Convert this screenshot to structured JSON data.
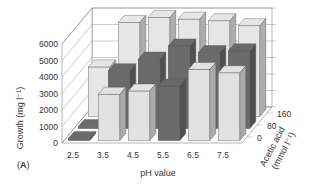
{
  "chart_data": {
    "type": "bar3d",
    "panel_label": "(A)",
    "xlabel": "pH value",
    "ylabel": "Growth (mg l⁻¹)",
    "zlabel_line1": "Acetic acid",
    "zlabel_line2": "(mmol l⁻¹)",
    "x_categories": [
      "2.5",
      "3.5",
      "4.5",
      "5.5",
      "6.5",
      "7.5"
    ],
    "z_categories": [
      "0",
      "80",
      "160"
    ],
    "y_ticks": [
      "0",
      "1000",
      "2000",
      "3000",
      "4000",
      "5000",
      "6000"
    ],
    "ylim": [
      0,
      6000
    ],
    "grid": true,
    "series": [
      {
        "name": "0",
        "color": "#e6e6e6",
        "values": [
          3000,
          5700,
          6000,
          5900,
          5800,
          5500
        ]
      },
      {
        "name": "80",
        "color": "#6a6a6a",
        "values": [
          100,
          3500,
          4200,
          5000,
          4600,
          4700
        ]
      },
      {
        "name": "160",
        "color": "#e2e2e2",
        "values": [
          50,
          2800,
          3000,
          3300,
          4300,
          4100
        ]
      }
    ],
    "front_row_dark_indices": [
      0,
      3
    ]
  }
}
